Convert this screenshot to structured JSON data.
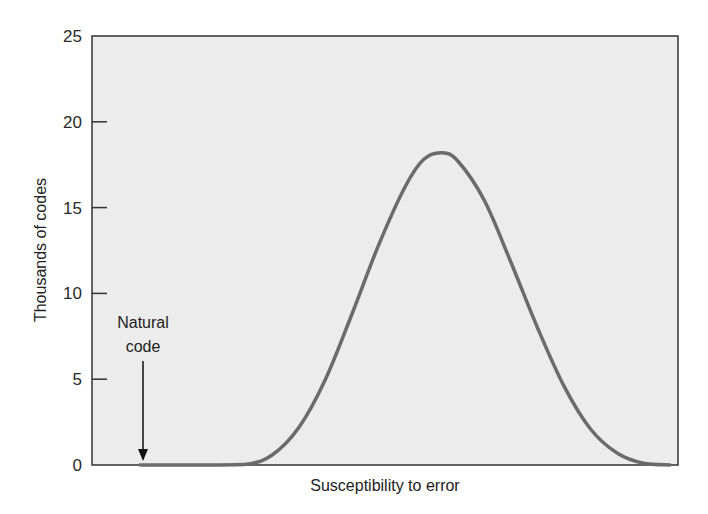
{
  "chart_data": {
    "type": "line",
    "title": "",
    "xlabel": "Susceptibility to error",
    "ylabel": "Thousands of codes",
    "ylim": [
      0,
      25
    ],
    "yticks": [
      0,
      5,
      10,
      15,
      20,
      25
    ],
    "xticks": [],
    "grid": false,
    "legend": null,
    "series": [
      {
        "name": "Distribution of alternative genetic codes",
        "x": [
          0.0,
          0.1,
          0.2,
          0.25,
          0.3,
          0.35,
          0.4,
          0.45,
          0.5,
          0.535,
          0.57,
          0.6,
          0.65,
          0.7,
          0.75,
          0.8,
          0.85,
          0.9,
          0.95,
          1.0
        ],
        "values": [
          0,
          0,
          0.05,
          0.6,
          2.2,
          5.0,
          8.8,
          12.8,
          16.2,
          17.8,
          18.2,
          17.7,
          15.4,
          11.8,
          8.0,
          4.6,
          2.1,
          0.7,
          0.1,
          0
        ]
      }
    ],
    "annotations": [
      {
        "text": "Natural code",
        "x": 0.09,
        "y": 0,
        "type": "arrow-down"
      }
    ],
    "colors": {
      "curve": "#6b6b6b",
      "plot_bg": "#ececec",
      "axis": "#333333"
    }
  },
  "labels": {
    "y_ticks": [
      "0",
      "5",
      "10",
      "15",
      "20",
      "25"
    ],
    "x_title": "Susceptibility to error",
    "y_title": "Thousands of codes",
    "annotation_line1": "Natural",
    "annotation_line2": "code"
  }
}
